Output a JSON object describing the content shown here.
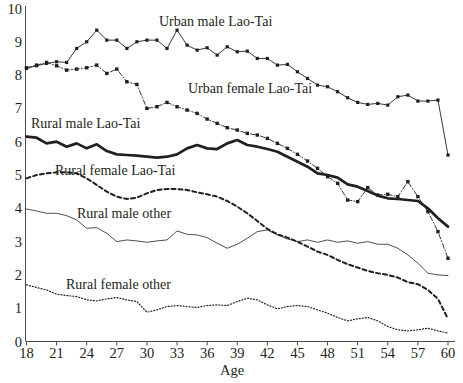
{
  "chart_data": {
    "type": "line",
    "title": "",
    "xlabel": "Age",
    "ylabel": "",
    "xlim": [
      18,
      60
    ],
    "ylim": [
      0,
      10
    ],
    "xticks": [
      18,
      21,
      24,
      27,
      30,
      33,
      36,
      39,
      42,
      45,
      48,
      51,
      54,
      57,
      60
    ],
    "yticks": [
      0,
      1,
      2,
      3,
      4,
      5,
      6,
      7,
      8,
      9,
      10
    ],
    "grid": false,
    "legend": "inline-annotations",
    "x": [
      18,
      19,
      20,
      21,
      22,
      23,
      24,
      25,
      26,
      27,
      28,
      29,
      30,
      31,
      32,
      33,
      34,
      35,
      36,
      37,
      38,
      39,
      40,
      41,
      42,
      43,
      44,
      45,
      46,
      47,
      48,
      49,
      50,
      51,
      52,
      53,
      54,
      55,
      56,
      57,
      58,
      59,
      60
    ],
    "series": [
      {
        "name": "Urban male Lao-Tai",
        "style": "thin-solid-with-markers",
        "values": [
          8.2,
          8.28,
          8.35,
          8.4,
          8.38,
          8.8,
          9.0,
          9.35,
          9.05,
          9.05,
          8.8,
          9.0,
          9.05,
          9.05,
          8.8,
          9.35,
          8.9,
          8.75,
          8.82,
          8.6,
          8.85,
          8.7,
          8.72,
          8.5,
          8.5,
          8.3,
          8.32,
          8.1,
          7.9,
          7.7,
          7.65,
          7.5,
          7.32,
          7.18,
          7.12,
          7.15,
          7.1,
          7.35,
          7.4,
          7.22,
          7.22,
          7.25,
          5.6
        ]
      },
      {
        "name": "Urban female Lao-Tai",
        "style": "dash-dot-with-markers",
        "values": [
          8.22,
          8.3,
          8.38,
          8.28,
          8.15,
          8.18,
          8.22,
          8.3,
          8.05,
          8.18,
          7.8,
          7.72,
          7.0,
          7.05,
          7.18,
          7.05,
          6.95,
          6.85,
          6.68,
          6.55,
          6.42,
          6.35,
          6.25,
          6.2,
          6.1,
          5.95,
          5.8,
          5.62,
          5.42,
          5.2,
          4.95,
          4.75,
          4.25,
          4.2,
          4.62,
          4.4,
          4.42,
          4.35,
          4.8,
          4.35,
          3.9,
          3.3,
          2.5
        ]
      },
      {
        "name": "Rural male Lao-Tai",
        "style": "thick-solid",
        "values": [
          6.15,
          6.12,
          5.95,
          6.0,
          5.85,
          5.95,
          5.8,
          5.92,
          5.72,
          5.62,
          5.6,
          5.58,
          5.55,
          5.52,
          5.55,
          5.62,
          5.8,
          5.9,
          5.8,
          5.78,
          5.95,
          6.05,
          5.9,
          5.85,
          5.78,
          5.7,
          5.55,
          5.4,
          5.25,
          5.05,
          5.0,
          4.92,
          4.72,
          4.65,
          4.52,
          4.38,
          4.3,
          4.28,
          4.25,
          4.22,
          4.0,
          3.7,
          3.45
        ]
      },
      {
        "name": "Rural female Lao-Tai",
        "style": "dashed-bold",
        "values": [
          4.9,
          5.0,
          5.05,
          5.08,
          5.08,
          5.05,
          4.9,
          4.7,
          4.5,
          4.35,
          4.28,
          4.32,
          4.45,
          4.55,
          4.58,
          4.58,
          4.55,
          4.48,
          4.42,
          4.35,
          4.22,
          4.05,
          3.85,
          3.62,
          3.38,
          3.22,
          3.12,
          3.0,
          2.85,
          2.7,
          2.6,
          2.45,
          2.32,
          2.22,
          2.12,
          2.05,
          2.0,
          1.92,
          1.78,
          1.72,
          1.55,
          1.28,
          0.68
        ]
      },
      {
        "name": "Rural male other",
        "style": "thin-solid",
        "values": [
          3.98,
          3.92,
          3.85,
          3.85,
          3.78,
          3.65,
          3.4,
          3.42,
          3.25,
          3.0,
          3.05,
          3.02,
          2.98,
          3.02,
          3.05,
          3.32,
          3.22,
          3.2,
          3.12,
          2.95,
          2.8,
          2.92,
          3.1,
          3.3,
          3.35,
          3.2,
          3.08,
          3.0,
          3.05,
          2.98,
          3.05,
          2.98,
          3.02,
          2.95,
          3.0,
          2.92,
          2.92,
          2.8,
          2.6,
          2.35,
          2.05,
          2.0,
          1.98
        ]
      },
      {
        "name": "Rural female other",
        "style": "dotted",
        "values": [
          1.7,
          1.62,
          1.55,
          1.42,
          1.38,
          1.35,
          1.25,
          1.22,
          1.28,
          1.32,
          1.25,
          1.2,
          0.88,
          0.95,
          1.05,
          1.08,
          1.05,
          1.02,
          1.08,
          1.1,
          1.08,
          1.2,
          1.3,
          1.25,
          1.1,
          0.98,
          1.05,
          1.08,
          1.05,
          0.95,
          0.85,
          0.72,
          0.62,
          0.68,
          0.72,
          0.62,
          0.45,
          0.35,
          0.32,
          0.35,
          0.4,
          0.32,
          0.25
        ]
      }
    ],
    "annotations": [
      {
        "text": "Urban male Lao-Tai",
        "x": 159,
        "y": 14
      },
      {
        "text": "Urban female Lao-Tai",
        "x": 188,
        "y": 81
      },
      {
        "text": "Rural male Lao-Tai",
        "x": 31,
        "y": 116
      },
      {
        "text": "Rural female Lao-Tai",
        "x": 55,
        "y": 163
      },
      {
        "text": "Rural male other",
        "x": 77,
        "y": 206
      },
      {
        "text": "Rural female other",
        "x": 66,
        "y": 277
      }
    ]
  },
  "axes": {
    "x_title": "Age",
    "x_tick_labels": [
      "18",
      "21",
      "24",
      "27",
      "30",
      "33",
      "36",
      "39",
      "42",
      "45",
      "48",
      "51",
      "54",
      "57",
      "60"
    ],
    "y_tick_labels": [
      "10",
      "9",
      "8",
      "7",
      "6",
      "5",
      "4",
      "3",
      "2",
      "1",
      "0"
    ]
  },
  "colors": {
    "ink": "#231f20",
    "axis": "#4a4a4a",
    "background": "#ffffff"
  }
}
